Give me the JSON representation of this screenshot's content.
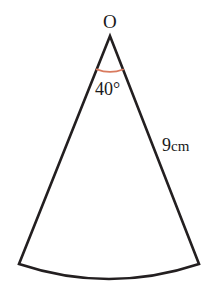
{
  "figure": {
    "kind": "circular-sector-diagram",
    "background_color": "#FFFFFF",
    "stroke_color": "#231F20",
    "stroke_width_px": 2.6,
    "angle_arc_color": "#D97A5E",
    "text_color": "#1A1A1A"
  },
  "labels": {
    "vertex": "O",
    "angle": "40°",
    "radius_value": "9",
    "radius_unit": "cm"
  },
  "chart_data": {
    "type": "diagram",
    "shape": "circular sector",
    "title": "",
    "center_label": "O",
    "central_angle_deg": 40,
    "radius": 9,
    "radius_unit": "cm",
    "annotations": [
      {
        "text": "O",
        "role": "vertex-label",
        "x": 110,
        "y": 22
      },
      {
        "text": "40°",
        "role": "central-angle-label",
        "x": 112,
        "y": 89
      },
      {
        "text": "9 cm",
        "role": "radius-label",
        "x": 182,
        "y": 145
      }
    ],
    "geometry_px": {
      "apex": [
        110,
        36
      ],
      "left_endpoint": [
        19,
        264
      ],
      "right_endpoint": [
        199,
        264
      ],
      "arc_midpoint": [
        109,
        279
      ],
      "radius_px": 245,
      "angle_marker_arc_radius_px": 36
    }
  }
}
